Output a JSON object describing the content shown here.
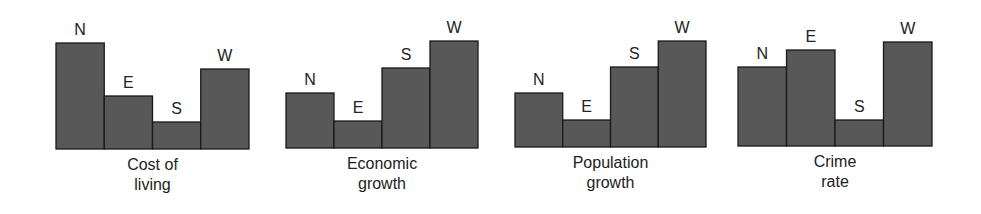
{
  "style": {
    "bar_fill": "#585858",
    "bar_stroke": "#1a1a1a",
    "text_color": "#222222",
    "background": "#ffffff"
  },
  "chart_data": [
    {
      "type": "bar",
      "title": "",
      "caption": [
        "Cost of",
        "living"
      ],
      "categories": [
        "N",
        "E",
        "S",
        "W"
      ],
      "values": [
        106,
        53,
        27,
        80
      ],
      "xlabel": "Cost of living",
      "ylabel": "",
      "axes_shown": false,
      "grid": false,
      "layout": {
        "x0": 56,
        "baseline": 149,
        "bar_width": 48.25
      }
    },
    {
      "type": "bar",
      "title": "",
      "caption": [
        "Economic",
        "growth"
      ],
      "categories": [
        "N",
        "E",
        "S",
        "W"
      ],
      "values": [
        55,
        27,
        80,
        107
      ],
      "xlabel": "Economic growth",
      "ylabel": "",
      "axes_shown": false,
      "grid": false,
      "layout": {
        "x0": 286,
        "baseline": 148,
        "bar_width": 48
      }
    },
    {
      "type": "bar",
      "title": "",
      "caption": [
        "Population",
        "growth"
      ],
      "categories": [
        "N",
        "E",
        "S",
        "W"
      ],
      "values": [
        54,
        27,
        80,
        106
      ],
      "xlabel": "Population growth",
      "ylabel": "",
      "axes_shown": false,
      "grid": false,
      "layout": {
        "x0": 515,
        "baseline": 147,
        "bar_width": 47.75
      }
    },
    {
      "type": "bar",
      "title": "",
      "caption": [
        "Crime",
        "rate"
      ],
      "categories": [
        "N",
        "E",
        "S",
        "W"
      ],
      "values": [
        79,
        96,
        26,
        104
      ],
      "xlabel": "Crime rate",
      "ylabel": "",
      "axes_shown": false,
      "grid": false,
      "layout": {
        "x0": 738,
        "baseline": 146,
        "bar_width": 48.5
      }
    }
  ]
}
